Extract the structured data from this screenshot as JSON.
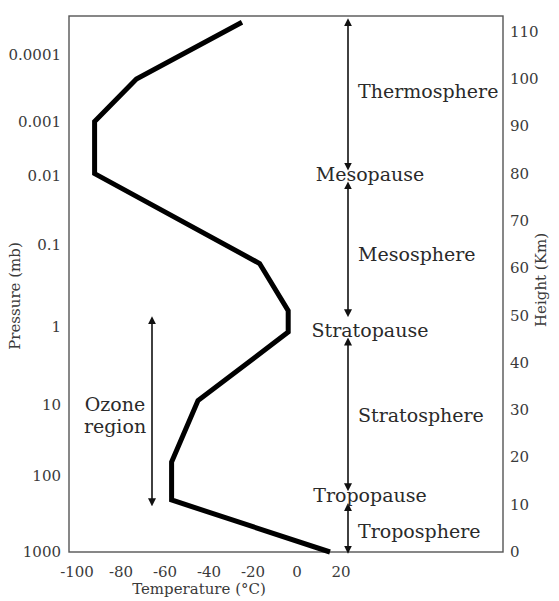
{
  "chart_data": {
    "type": "line",
    "title": "",
    "xlabel": "Temperature (°C)",
    "ylabel_left": "Pressure (mb)",
    "ylabel_right": "Height (Km)",
    "xlim": [
      -100,
      20
    ],
    "ylim_height_km": [
      0,
      110
    ],
    "grid": false,
    "x_ticks": [
      -100,
      -80,
      -60,
      -40,
      -20,
      0,
      20
    ],
    "x_tick_labels": [
      "-100",
      "-80",
      "-60",
      "-40",
      "-20",
      "0",
      "20"
    ],
    "height_ticks": [
      0,
      10,
      20,
      30,
      40,
      50,
      60,
      70,
      80,
      90,
      100,
      110
    ],
    "height_tick_labels": [
      "0",
      "10",
      "20",
      "30",
      "40",
      "50",
      "60",
      "70",
      "80",
      "90",
      "100",
      "110"
    ],
    "pressure_ticks": [
      {
        "label": "0.0001",
        "height_km": 105
      },
      {
        "label": "0.001",
        "height_km": 91
      },
      {
        "label": "0.01",
        "height_km": 79.5
      },
      {
        "label": "0.1",
        "height_km": 65
      },
      {
        "label": "1",
        "height_km": 47.5
      },
      {
        "label": "10",
        "height_km": 31
      },
      {
        "label": "100",
        "height_km": 16
      },
      {
        "label": "1000",
        "height_km": 0
      }
    ],
    "series": [
      {
        "name": "Temperature profile",
        "points": [
          {
            "temp_c": 15,
            "height_km": 0
          },
          {
            "temp_c": -57,
            "height_km": 11
          },
          {
            "temp_c": -57,
            "height_km": 19
          },
          {
            "temp_c": -45,
            "height_km": 32
          },
          {
            "temp_c": -4,
            "height_km": 46.5
          },
          {
            "temp_c": -4,
            "height_km": 51
          },
          {
            "temp_c": -17,
            "height_km": 61
          },
          {
            "temp_c": -92,
            "height_km": 80
          },
          {
            "temp_c": -92,
            "height_km": 91
          },
          {
            "temp_c": -73,
            "height_km": 100
          },
          {
            "temp_c": -25,
            "height_km": 112
          }
        ]
      }
    ],
    "annotations": {
      "layers": [
        {
          "name": "Thermosphere",
          "from_km": 81.5,
          "to_km": 112,
          "label_km": 97.5
        },
        {
          "name": "Mesosphere",
          "from_km": 50.5,
          "to_km": 77.5,
          "label_km": 63
        },
        {
          "name": "Stratosphere",
          "from_km": 13.7,
          "to_km": 44.5,
          "label_km": 29
        },
        {
          "name": "Troposphere",
          "from_km": 0.5,
          "to_km": 9.5,
          "label_km": 4.5
        }
      ],
      "boundaries": [
        {
          "name": "Mesopause",
          "label_km": 80
        },
        {
          "name": "Stratopause",
          "label_km": 47
        },
        {
          "name": "Tropopause",
          "label_km": 12
        }
      ],
      "ozone": {
        "line1": "Ozone",
        "line2": "region",
        "from_km": 49,
        "to_km": 10.5
      }
    }
  }
}
